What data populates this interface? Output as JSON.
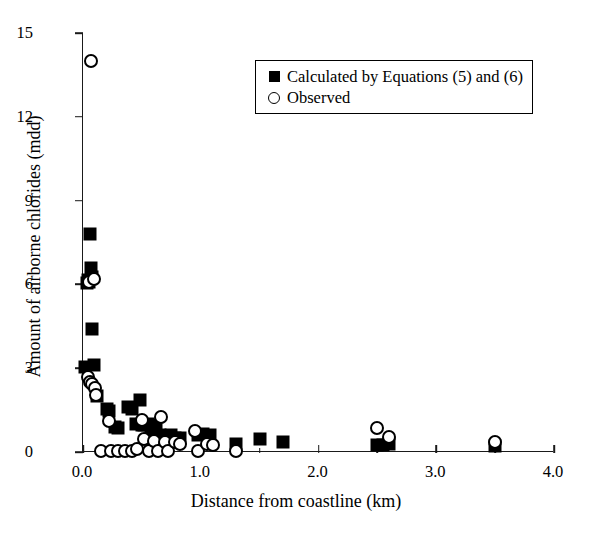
{
  "chart_data": {
    "type": "scatter",
    "title": "",
    "xlabel": "Distance from coastline (km)",
    "ylabel": "Amount of airborne chlorides (mdd)",
    "xlim": [
      0.0,
      4.0
    ],
    "ylim": [
      0,
      15
    ],
    "xticks": [
      "0.0",
      "1.0",
      "2.0",
      "3.0",
      "4.0"
    ],
    "xtick_values": [
      0.0,
      1.0,
      2.0,
      3.0,
      4.0
    ],
    "xminor_values": [
      0.5,
      1.5,
      2.5,
      3.5
    ],
    "yticks": [
      "0",
      "3",
      "6",
      "9",
      "12",
      "15"
    ],
    "ytick_values": [
      0,
      3,
      6,
      9,
      12,
      15
    ],
    "grid": false,
    "legend_position": "upper center",
    "series": [
      {
        "name": "Calculated by Equations (5) and (6)",
        "marker": "filled-square",
        "color": "#000000",
        "points": [
          [
            0.02,
            3.05
          ],
          [
            0.03,
            6.05
          ],
          [
            0.04,
            6.15
          ],
          [
            0.05,
            6.1
          ],
          [
            0.06,
            7.8
          ],
          [
            0.07,
            6.6
          ],
          [
            0.08,
            6.25
          ],
          [
            0.08,
            4.4
          ],
          [
            0.09,
            3.1
          ],
          [
            0.12,
            2.0
          ],
          [
            0.2,
            1.55
          ],
          [
            0.22,
            1.45
          ],
          [
            0.27,
            0.9
          ],
          [
            0.3,
            0.85
          ],
          [
            0.38,
            1.6
          ],
          [
            0.42,
            1.55
          ],
          [
            0.45,
            1.0
          ],
          [
            0.48,
            1.85
          ],
          [
            0.5,
            0.95
          ],
          [
            0.52,
            0.95
          ],
          [
            0.55,
            1.0
          ],
          [
            0.58,
            0.55
          ],
          [
            0.62,
            0.95
          ],
          [
            0.65,
            0.6
          ],
          [
            0.68,
            0.55
          ],
          [
            0.72,
            0.55
          ],
          [
            0.75,
            0.6
          ],
          [
            0.78,
            0.5
          ],
          [
            0.82,
            0.5
          ],
          [
            0.98,
            0.6
          ],
          [
            1.02,
            0.65
          ],
          [
            1.08,
            0.6
          ],
          [
            1.3,
            0.3
          ],
          [
            1.5,
            0.45
          ],
          [
            1.7,
            0.35
          ],
          [
            2.5,
            0.25
          ],
          [
            2.55,
            0.25
          ],
          [
            2.6,
            0.3
          ],
          [
            3.5,
            0.2
          ]
        ]
      },
      {
        "name": "Observed",
        "marker": "open-circle",
        "color": "#000000",
        "points": [
          [
            0.07,
            14.0
          ],
          [
            0.05,
            6.1
          ],
          [
            0.09,
            6.2
          ],
          [
            0.04,
            2.7
          ],
          [
            0.06,
            2.5
          ],
          [
            0.08,
            2.45
          ],
          [
            0.1,
            2.3
          ],
          [
            0.11,
            2.05
          ],
          [
            0.15,
            0.05
          ],
          [
            0.22,
            1.1
          ],
          [
            0.24,
            0.05
          ],
          [
            0.3,
            0.05
          ],
          [
            0.36,
            0.05
          ],
          [
            0.42,
            0.05
          ],
          [
            0.46,
            0.1
          ],
          [
            0.5,
            1.15
          ],
          [
            0.52,
            0.45
          ],
          [
            0.56,
            0.05
          ],
          [
            0.6,
            0.4
          ],
          [
            0.64,
            0.05
          ],
          [
            0.66,
            1.25
          ],
          [
            0.7,
            0.35
          ],
          [
            0.72,
            0.05
          ],
          [
            0.78,
            0.35
          ],
          [
            0.82,
            0.3
          ],
          [
            0.95,
            0.75
          ],
          [
            0.98,
            0.05
          ],
          [
            1.05,
            0.3
          ],
          [
            1.1,
            0.25
          ],
          [
            1.3,
            0.05
          ],
          [
            2.5,
            0.85
          ],
          [
            2.6,
            0.55
          ],
          [
            3.5,
            0.35
          ]
        ]
      }
    ]
  },
  "legend": {
    "entries": [
      {
        "label": "Calculated by Equations (5) and (6)",
        "marker": "filled-square"
      },
      {
        "label": "Observed",
        "marker": "open-circle"
      }
    ]
  }
}
